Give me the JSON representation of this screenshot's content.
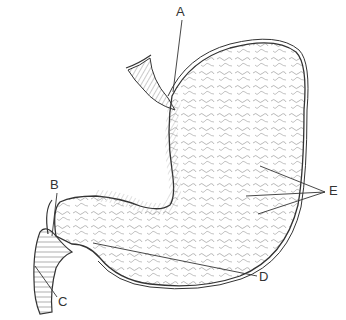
{
  "diagram": {
    "labels": [
      {
        "id": "A",
        "text": "A",
        "x": 176,
        "y": 5
      },
      {
        "id": "B",
        "text": "B",
        "x": 50,
        "y": 178
      },
      {
        "id": "C",
        "text": "C",
        "x": 58,
        "y": 295
      },
      {
        "id": "D",
        "text": "D",
        "x": 259,
        "y": 270
      },
      {
        "id": "E",
        "text": "E",
        "x": 329,
        "y": 184
      }
    ],
    "colors": {
      "line": "#333333",
      "texture": "#777777",
      "background": "#ffffff"
    }
  }
}
